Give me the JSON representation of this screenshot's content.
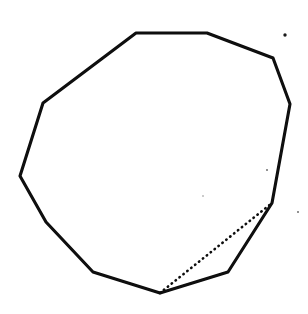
{
  "figure": {
    "type": "line-drawing",
    "width": 308,
    "height": 314,
    "background_color": "#ffffff",
    "stroke_color": "#0d0d0d",
    "stroke_width": 3.1
  },
  "chart_data": {
    "type": "scatter",
    "xlabel": "",
    "ylabel": "",
    "xlim": [
      0,
      308
    ],
    "ylim": [
      314,
      0
    ],
    "grid": false,
    "legend": "none",
    "annotations": [],
    "series": [
      {
        "name": "polygon-outline",
        "style": "solid",
        "closed": true,
        "color": "#0d0d0d",
        "vertex_count": 11,
        "x": [
          136,
          207,
          273,
          290,
          272,
          228,
          160,
          93,
          46,
          20,
          43
        ],
        "y": [
          33,
          33,
          58,
          104,
          203,
          272,
          293,
          272,
          222,
          176,
          103
        ]
      },
      {
        "name": "dotted-chord",
        "style": "dotted",
        "closed": false,
        "color": "#0d0d0d",
        "vertex_count": 2,
        "x": [
          160,
          272
        ],
        "y": [
          293,
          203
        ]
      }
    ],
    "specks": [
      {
        "x": 285,
        "y": 35,
        "r": 1.7,
        "color": "#1a1a1a"
      },
      {
        "x": 267,
        "y": 170,
        "r": 1.0,
        "color": "#6f6f6f"
      },
      {
        "x": 298,
        "y": 212,
        "r": 1.0,
        "color": "#6f6f6f"
      },
      {
        "x": 203,
        "y": 196,
        "r": 0.8,
        "color": "#8a8a8a"
      }
    ]
  },
  "shapes": {
    "polygon_label": "polygon",
    "chord_label": "dotted chord",
    "polygon_points": "136,33 207,33 273,58 290,104 272,203 228,272 160,293 93,272 46,222 20,176 43,103",
    "polygon_ink_path": "M136,33 L207,33 L273,58 L290,104 L272,203 L228,272 L160,293 L93,272 L46,222 L20,176 L43,103 Z",
    "chord_path": "M160,293 L272,203"
  }
}
